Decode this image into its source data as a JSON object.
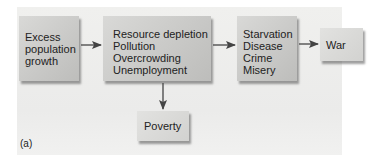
{
  "diagram": {
    "nodes": [
      {
        "id": "excess-population-growth",
        "lines": [
          "Excess",
          "population",
          "growth"
        ]
      },
      {
        "id": "resource-depletion",
        "lines": [
          "Resource depletion",
          "Pollution",
          "Overcrowding",
          "Unemployment"
        ]
      },
      {
        "id": "starvation",
        "lines": [
          "Starvation",
          "Disease",
          "Crime",
          "Misery"
        ]
      },
      {
        "id": "war",
        "lines": [
          "War"
        ]
      },
      {
        "id": "poverty",
        "lines": [
          "Poverty"
        ]
      }
    ],
    "edges": [
      {
        "from": "excess-population-growth",
        "to": "resource-depletion"
      },
      {
        "from": "resource-depletion",
        "to": "starvation"
      },
      {
        "from": "starvation",
        "to": "war"
      },
      {
        "from": "resource-depletion",
        "to": "poverty"
      }
    ],
    "panel_label": "(a)",
    "colors": {
      "box": "#c8c8c6",
      "background": "#ebebea",
      "arrow": "#444444"
    }
  }
}
